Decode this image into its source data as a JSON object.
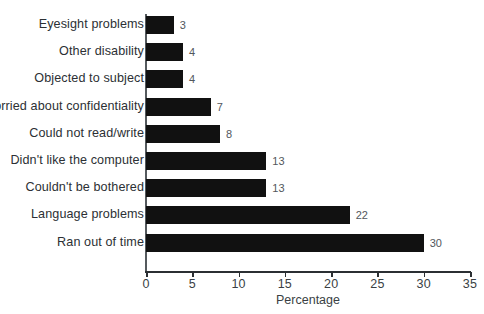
{
  "chart_data": {
    "type": "bar",
    "orientation": "horizontal",
    "title": "",
    "xlabel": "Percentage",
    "ylabel": "",
    "xlim": [
      0,
      35
    ],
    "xticks": [
      0,
      5,
      10,
      15,
      20,
      25,
      30,
      35
    ],
    "grid": false,
    "legend": null,
    "bar_color": "#111111",
    "value_label_color": "#52575c",
    "axis_color": "#2b2f33",
    "background": "#ffffff",
    "categories": [
      "Eyesight problems",
      "Other disability",
      "Objected to subject",
      "Worried about confidentiality",
      "Could not read/write",
      "Didn't like the computer",
      "Couldn't be bothered",
      "Language problems",
      "Ran out of time"
    ],
    "values": [
      3,
      4,
      4,
      7,
      8,
      13,
      13,
      22,
      30
    ],
    "value_labels": [
      "3",
      "4",
      "4",
      "7",
      "8",
      "13",
      "13",
      "22",
      "30"
    ],
    "tick_labels": [
      "0",
      "5",
      "10",
      "15",
      "20",
      "25",
      "30",
      "35"
    ]
  }
}
